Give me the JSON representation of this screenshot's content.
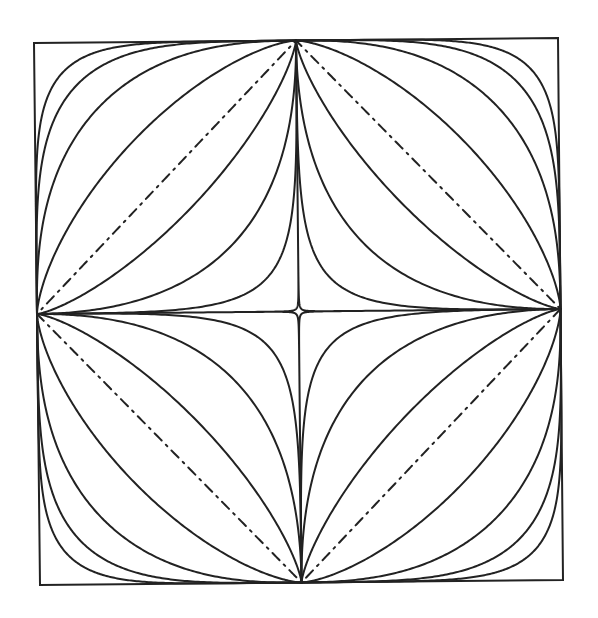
{
  "diagram": {
    "title": "",
    "background": "#ffffff",
    "stroke_color": "#222222",
    "stroke_width": 2,
    "frame": {
      "corners": {
        "top_left": [
          34,
          43
        ],
        "top_right": [
          558,
          38
        ],
        "bottom_right": [
          563,
          580
        ],
        "bottom_left": [
          40,
          585
        ]
      }
    },
    "curves": [
      {
        "name": "superellipse-n-6",
        "exponent": 6,
        "style": "solid"
      },
      {
        "name": "superellipse-n-4",
        "exponent": 4,
        "style": "solid"
      },
      {
        "name": "superellipse-n-2.5",
        "exponent": 2.5,
        "style": "solid"
      },
      {
        "name": "superellipse-n-1.5",
        "exponent": 1.5,
        "style": "solid"
      },
      {
        "name": "superellipse-n-1-diamond",
        "exponent": 1,
        "style": "dashdot"
      },
      {
        "name": "superellipse-n-0.75",
        "exponent": 0.75,
        "style": "solid"
      },
      {
        "name": "superellipse-n-0.5-astroid-like",
        "exponent": 0.5,
        "style": "solid"
      },
      {
        "name": "superellipse-n-0.33",
        "exponent": 0.33,
        "style": "solid"
      },
      {
        "name": "superellipse-n-0.15-star",
        "exponent": 0.15,
        "style": "solid"
      }
    ]
  }
}
